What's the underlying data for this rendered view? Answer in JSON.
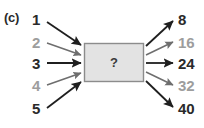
{
  "panel": {
    "label": "(c)",
    "question_mark": "?"
  },
  "colors": {
    "dark_text": "#2a2a2a",
    "light_text": "#9d9d9d",
    "box_fill": "#e3e3e3",
    "box_stroke": "#8c8c8c",
    "arrow_dark": "#1f1f1f",
    "arrow_light": "#6e6e6e",
    "background": "#ffffff"
  },
  "inputs": [
    {
      "label": "1",
      "tone": "dark",
      "x": 32,
      "y": 12,
      "arrow_from_x": 47,
      "arrow_from_y": 22,
      "arrow_to_x": 81,
      "arrow_to_y": 45
    },
    {
      "label": "2",
      "tone": "light",
      "x": 32,
      "y": 35,
      "arrow_from_x": 47,
      "arrow_from_y": 43,
      "arrow_to_x": 81,
      "arrow_to_y": 55
    },
    {
      "label": "3",
      "tone": "dark",
      "x": 32,
      "y": 56,
      "arrow_from_x": 47,
      "arrow_from_y": 63,
      "arrow_to_x": 81,
      "arrow_to_y": 63
    },
    {
      "label": "4",
      "tone": "light",
      "x": 32,
      "y": 78,
      "arrow_from_x": 47,
      "arrow_from_y": 85,
      "arrow_to_x": 81,
      "arrow_to_y": 73
    },
    {
      "label": "5",
      "tone": "dark",
      "x": 32,
      "y": 101,
      "arrow_from_x": 47,
      "arrow_from_y": 108,
      "arrow_to_x": 81,
      "arrow_to_y": 82
    }
  ],
  "outputs": [
    {
      "label": "8",
      "tone": "dark",
      "x": 178,
      "y": 12,
      "arrow_from_x": 146,
      "arrow_from_y": 46,
      "arrow_to_x": 173,
      "arrow_to_y": 21
    },
    {
      "label": "16",
      "tone": "light",
      "x": 178,
      "y": 35,
      "arrow_from_x": 146,
      "arrow_from_y": 55,
      "arrow_to_x": 173,
      "arrow_to_y": 42
    },
    {
      "label": "24",
      "tone": "dark",
      "x": 178,
      "y": 56,
      "arrow_from_x": 146,
      "arrow_from_y": 63,
      "arrow_to_x": 173,
      "arrow_to_y": 63
    },
    {
      "label": "32",
      "tone": "light",
      "x": 178,
      "y": 78,
      "arrow_from_x": 146,
      "arrow_from_y": 72,
      "arrow_to_x": 173,
      "arrow_to_y": 85
    },
    {
      "label": "40",
      "tone": "dark",
      "x": 178,
      "y": 101,
      "arrow_from_x": 146,
      "arrow_from_y": 81,
      "arrow_to_x": 173,
      "arrow_to_y": 107
    }
  ],
  "box": {
    "x": 84,
    "y": 43,
    "width": 60,
    "height": 39
  }
}
